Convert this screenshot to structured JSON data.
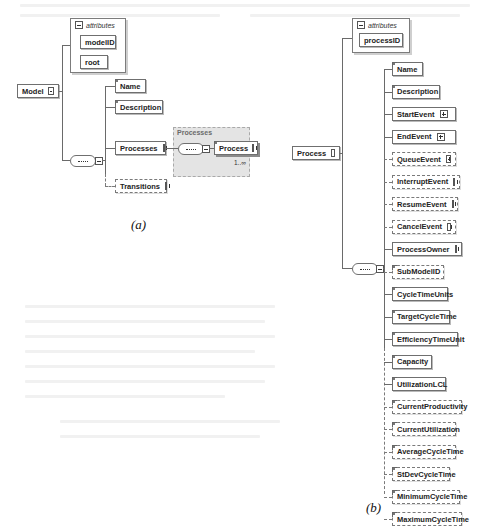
{
  "figure_a": {
    "caption": "(a)",
    "root": "Model",
    "attributes_label": "attributes",
    "attributes": [
      "modelID",
      "root"
    ],
    "children": [
      {
        "label": "Name",
        "optional": false,
        "expandable": false
      },
      {
        "label": "Description",
        "optional": false,
        "expandable": false
      },
      {
        "label": "Processes",
        "optional": false,
        "expandable": true
      },
      {
        "label": "Transitions",
        "optional": true,
        "expandable": true
      }
    ],
    "processes_group": {
      "label": "Processes",
      "child": "Process",
      "cardinality": "1..∞"
    }
  },
  "figure_b": {
    "caption": "(b)",
    "root": "Process",
    "attributes_label": "attributes",
    "attributes": [
      "processID"
    ],
    "children": [
      {
        "label": "Name",
        "optional": false,
        "expandable": false
      },
      {
        "label": "Description",
        "optional": false,
        "expandable": false
      },
      {
        "label": "StartEvent",
        "optional": false,
        "expandable": true
      },
      {
        "label": "EndEvent",
        "optional": false,
        "expandable": true
      },
      {
        "label": "QueueEvent",
        "optional": true,
        "expandable": true
      },
      {
        "label": "InterruptEvent",
        "optional": true,
        "expandable": true
      },
      {
        "label": "ResumeEvent",
        "optional": true,
        "expandable": true
      },
      {
        "label": "CancelEvent",
        "optional": true,
        "expandable": true
      },
      {
        "label": "ProcessOwner",
        "optional": false,
        "expandable": true
      },
      {
        "label": "SubModelID",
        "optional": true,
        "expandable": false
      },
      {
        "label": "CycleTimeUnits",
        "optional": false,
        "expandable": false
      },
      {
        "label": "TargetCycleTime",
        "optional": false,
        "expandable": false
      },
      {
        "label": "EfficiencyTimeUnit",
        "optional": false,
        "expandable": false
      },
      {
        "label": "Capacity",
        "optional": false,
        "expandable": false
      },
      {
        "label": "UtilizationLCL",
        "optional": false,
        "expandable": false
      },
      {
        "label": "CurrentProductivity",
        "optional": true,
        "expandable": false
      },
      {
        "label": "CurrentUtilization",
        "optional": true,
        "expandable": false
      },
      {
        "label": "AverageCycleTime",
        "optional": true,
        "expandable": false
      },
      {
        "label": "StDevCycleTime",
        "optional": true,
        "expandable": false
      },
      {
        "label": "MinimumCycleTime",
        "optional": true,
        "expandable": false
      },
      {
        "label": "MaximumCycleTime",
        "optional": true,
        "expandable": false
      }
    ]
  }
}
